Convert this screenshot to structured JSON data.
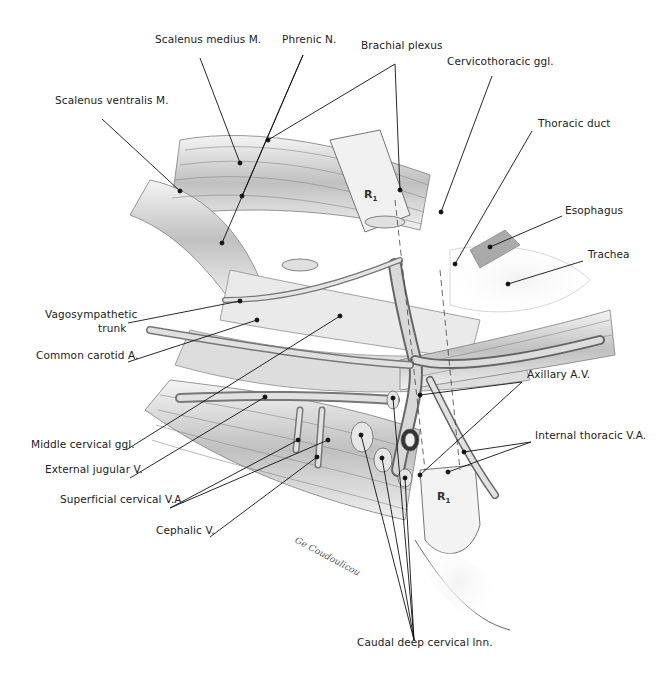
{
  "figure": {
    "labels": [
      {
        "id": "scalenus-medius",
        "text": "Scalenus medius M.",
        "x": 155,
        "y": 40,
        "align": "left"
      },
      {
        "id": "phrenic-n",
        "text": "Phrenic N.",
        "x": 282,
        "y": 40,
        "align": "left"
      },
      {
        "id": "brachial-plexus",
        "text": "Brachial plexus",
        "x": 361,
        "y": 46,
        "align": "left"
      },
      {
        "id": "cervicothoracic-ggl",
        "text": "Cervicothoracic ggl.",
        "x": 447,
        "y": 62,
        "align": "left"
      },
      {
        "id": "scalenus-ventralis",
        "text": "Scalenus ventralis M.",
        "x": 55,
        "y": 101,
        "align": "left"
      },
      {
        "id": "thoracic-duct",
        "text": "Thoracic duct",
        "x": 538,
        "y": 124,
        "align": "left"
      },
      {
        "id": "esophagus",
        "text": "Esophagus",
        "x": 565,
        "y": 211,
        "align": "left"
      },
      {
        "id": "trachea",
        "text": "Trachea",
        "x": 588,
        "y": 255,
        "align": "left"
      },
      {
        "id": "vagosympathetic-trunk-1",
        "text": "Vagosympathetic",
        "x": 45,
        "y": 315,
        "align": "left"
      },
      {
        "id": "vagosympathetic-trunk-2",
        "text": "trunk",
        "x": 98,
        "y": 329,
        "align": "left"
      },
      {
        "id": "common-carotid",
        "text": "Common carotid A.",
        "x": 36,
        "y": 356,
        "align": "left"
      },
      {
        "id": "axillary-av",
        "text": "Axillary A.V.",
        "x": 527,
        "y": 375,
        "align": "left"
      },
      {
        "id": "middle-cervical-ggl",
        "text": "Middle cervical ggl.",
        "x": 31,
        "y": 445,
        "align": "left"
      },
      {
        "id": "internal-thoracic-va",
        "text": "Internal thoracic V.A.",
        "x": 535,
        "y": 436,
        "align": "left"
      },
      {
        "id": "external-jugular",
        "text": "External jugular V.",
        "x": 45,
        "y": 470,
        "align": "left"
      },
      {
        "id": "superficial-cervical-va",
        "text": "Superficial cervical V.A.",
        "x": 60,
        "y": 500,
        "align": "left"
      },
      {
        "id": "cephalic-v",
        "text": "Cephalic V.",
        "x": 156,
        "y": 531,
        "align": "left"
      },
      {
        "id": "caudal-deep-cervical-lnn",
        "text": "Caudal deep cervical lnn.",
        "x": 357,
        "y": 643,
        "align": "left"
      }
    ],
    "rib_labels": [
      {
        "id": "r1-top",
        "text": "R",
        "sub": "1",
        "x": 364,
        "y": 188
      },
      {
        "id": "r1-bottom",
        "text": "R",
        "sub": "1",
        "x": 437,
        "y": 490
      }
    ],
    "signature": "artist signature (illegible script)"
  },
  "leaders": [
    {
      "from": [
        200,
        58
      ],
      "to": [
        240,
        163
      ]
    },
    {
      "from": [
        303,
        55
      ],
      "to": [
        242,
        196
      ]
    },
    {
      "from": [
        303,
        55
      ],
      "to": [
        222,
        243
      ]
    },
    {
      "from": [
        395,
        64
      ],
      "to": [
        268,
        140
      ]
    },
    {
      "from": [
        395,
        64
      ],
      "to": [
        400,
        190
      ]
    },
    {
      "from": [
        492,
        76
      ],
      "to": [
        441,
        212
      ]
    },
    {
      "from": [
        102,
        119
      ],
      "to": [
        180,
        191
      ]
    },
    {
      "from": [
        532,
        131
      ],
      "to": [
        455,
        264
      ]
    },
    {
      "from": [
        562,
        216
      ],
      "to": [
        490,
        247
      ]
    },
    {
      "from": [
        583,
        261
      ],
      "to": [
        508,
        284
      ]
    },
    {
      "from": [
        128,
        323
      ],
      "to": [
        240,
        301
      ]
    },
    {
      "from": [
        128,
        362
      ],
      "to": [
        257,
        320
      ]
    },
    {
      "from": [
        522,
        382
      ],
      "to": [
        420,
        395
      ]
    },
    {
      "from": [
        522,
        382
      ],
      "to": [
        420,
        475
      ]
    },
    {
      "from": [
        126,
        450
      ],
      "to": [
        340,
        316
      ]
    },
    {
      "from": [
        531,
        442
      ],
      "to": [
        464,
        452
      ]
    },
    {
      "from": [
        531,
        442
      ],
      "to": [
        448,
        472
      ]
    },
    {
      "from": [
        130,
        478
      ],
      "to": [
        265,
        397
      ]
    },
    {
      "from": [
        170,
        508
      ],
      "to": [
        298,
        440
      ]
    },
    {
      "from": [
        170,
        508
      ],
      "to": [
        328,
        440
      ]
    },
    {
      "from": [
        210,
        537
      ],
      "to": [
        317,
        457
      ]
    },
    {
      "from": [
        414,
        640
      ],
      "to": [
        361,
        435
      ]
    },
    {
      "from": [
        414,
        640
      ],
      "to": [
        382,
        458
      ]
    },
    {
      "from": [
        414,
        640
      ],
      "to": [
        405,
        478
      ]
    },
    {
      "from": [
        414,
        640
      ],
      "to": [
        393,
        398
      ]
    }
  ],
  "colors": {
    "text": "#222222",
    "line": "#111111",
    "muscle_light": "#e8e8e8",
    "muscle_dark": "#8a8a8a",
    "vessel": "#bdbdbd",
    "background": "#ffffff"
  }
}
